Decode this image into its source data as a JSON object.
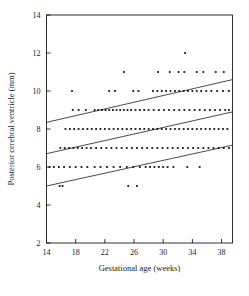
{
  "chart_data": {
    "type": "scatter",
    "title": "",
    "xlabel": "Gestational age (weeks)",
    "ylabel": "Posterior cerebral ventricle (mm)",
    "xlim": [
      14,
      39.5
    ],
    "ylim": [
      2,
      14
    ],
    "xticks": [
      14,
      18,
      22,
      26,
      30,
      34,
      38
    ],
    "xticklabels": [
      "14",
      "18",
      "22",
      "26",
      "30",
      "34",
      "38"
    ],
    "yticks": [
      2,
      4,
      6,
      8,
      10,
      12,
      14
    ],
    "yticklabels": [
      "2",
      "4",
      "6",
      "8",
      "10",
      "12",
      "14"
    ],
    "grid": false,
    "legend": null,
    "marker": "small-filled-square",
    "marker_color": "#111111",
    "points": [
      {
        "x": 33.0,
        "y": 12
      },
      {
        "x": 24.6,
        "y": 11
      },
      {
        "x": 29.3,
        "y": 11
      },
      {
        "x": 30.9,
        "y": 11
      },
      {
        "x": 32.1,
        "y": 11
      },
      {
        "x": 32.9,
        "y": 11
      },
      {
        "x": 34.6,
        "y": 11
      },
      {
        "x": 35.5,
        "y": 11
      },
      {
        "x": 37.2,
        "y": 11
      },
      {
        "x": 38.3,
        "y": 11
      },
      {
        "x": 17.5,
        "y": 10
      },
      {
        "x": 22.6,
        "y": 10
      },
      {
        "x": 23.4,
        "y": 10
      },
      {
        "x": 25.9,
        "y": 10
      },
      {
        "x": 26.6,
        "y": 10
      },
      {
        "x": 28.6,
        "y": 10
      },
      {
        "x": 29.2,
        "y": 10
      },
      {
        "x": 29.8,
        "y": 10
      },
      {
        "x": 30.4,
        "y": 10
      },
      {
        "x": 31.0,
        "y": 10
      },
      {
        "x": 31.6,
        "y": 10
      },
      {
        "x": 32.2,
        "y": 10
      },
      {
        "x": 32.8,
        "y": 10
      },
      {
        "x": 33.4,
        "y": 10
      },
      {
        "x": 34.0,
        "y": 10
      },
      {
        "x": 34.6,
        "y": 10
      },
      {
        "x": 35.2,
        "y": 10
      },
      {
        "x": 35.9,
        "y": 10
      },
      {
        "x": 36.6,
        "y": 10
      },
      {
        "x": 37.4,
        "y": 10
      },
      {
        "x": 38.2,
        "y": 10
      },
      {
        "x": 39.0,
        "y": 10
      },
      {
        "x": 17.6,
        "y": 9
      },
      {
        "x": 18.4,
        "y": 9
      },
      {
        "x": 19.4,
        "y": 9
      },
      {
        "x": 20.6,
        "y": 9
      },
      {
        "x": 21.1,
        "y": 9
      },
      {
        "x": 21.6,
        "y": 9
      },
      {
        "x": 22.1,
        "y": 9
      },
      {
        "x": 22.6,
        "y": 9
      },
      {
        "x": 23.1,
        "y": 9
      },
      {
        "x": 23.6,
        "y": 9
      },
      {
        "x": 24.1,
        "y": 9
      },
      {
        "x": 24.6,
        "y": 9
      },
      {
        "x": 25.1,
        "y": 9
      },
      {
        "x": 25.6,
        "y": 9
      },
      {
        "x": 26.2,
        "y": 9
      },
      {
        "x": 26.8,
        "y": 9
      },
      {
        "x": 27.4,
        "y": 9
      },
      {
        "x": 28.0,
        "y": 9
      },
      {
        "x": 28.7,
        "y": 9
      },
      {
        "x": 29.4,
        "y": 9
      },
      {
        "x": 30.1,
        "y": 9
      },
      {
        "x": 30.8,
        "y": 9
      },
      {
        "x": 31.5,
        "y": 9
      },
      {
        "x": 32.2,
        "y": 9
      },
      {
        "x": 32.9,
        "y": 9
      },
      {
        "x": 33.6,
        "y": 9
      },
      {
        "x": 34.3,
        "y": 9
      },
      {
        "x": 35.0,
        "y": 9
      },
      {
        "x": 35.7,
        "y": 9
      },
      {
        "x": 36.4,
        "y": 9
      },
      {
        "x": 37.1,
        "y": 9
      },
      {
        "x": 37.8,
        "y": 9
      },
      {
        "x": 38.5,
        "y": 9
      },
      {
        "x": 39.0,
        "y": 9
      },
      {
        "x": 16.6,
        "y": 8
      },
      {
        "x": 17.2,
        "y": 8
      },
      {
        "x": 17.8,
        "y": 8
      },
      {
        "x": 18.4,
        "y": 8
      },
      {
        "x": 19.0,
        "y": 8
      },
      {
        "x": 19.6,
        "y": 8
      },
      {
        "x": 20.2,
        "y": 8
      },
      {
        "x": 20.8,
        "y": 8
      },
      {
        "x": 21.4,
        "y": 8
      },
      {
        "x": 22.0,
        "y": 8
      },
      {
        "x": 22.6,
        "y": 8
      },
      {
        "x": 23.2,
        "y": 8
      },
      {
        "x": 23.8,
        "y": 8
      },
      {
        "x": 24.4,
        "y": 8
      },
      {
        "x": 25.0,
        "y": 8
      },
      {
        "x": 25.6,
        "y": 8
      },
      {
        "x": 26.2,
        "y": 8
      },
      {
        "x": 26.8,
        "y": 8
      },
      {
        "x": 27.4,
        "y": 8
      },
      {
        "x": 28.0,
        "y": 8
      },
      {
        "x": 28.6,
        "y": 8
      },
      {
        "x": 29.2,
        "y": 8
      },
      {
        "x": 29.8,
        "y": 8
      },
      {
        "x": 30.4,
        "y": 8
      },
      {
        "x": 31.0,
        "y": 8
      },
      {
        "x": 31.6,
        "y": 8
      },
      {
        "x": 32.2,
        "y": 8
      },
      {
        "x": 32.8,
        "y": 8
      },
      {
        "x": 33.4,
        "y": 8
      },
      {
        "x": 34.0,
        "y": 8
      },
      {
        "x": 34.6,
        "y": 8
      },
      {
        "x": 35.2,
        "y": 8
      },
      {
        "x": 35.8,
        "y": 8
      },
      {
        "x": 36.4,
        "y": 8
      },
      {
        "x": 37.0,
        "y": 8
      },
      {
        "x": 37.6,
        "y": 8
      },
      {
        "x": 38.2,
        "y": 8
      },
      {
        "x": 38.8,
        "y": 8
      },
      {
        "x": 15.9,
        "y": 7
      },
      {
        "x": 16.5,
        "y": 7
      },
      {
        "x": 17.1,
        "y": 7
      },
      {
        "x": 17.7,
        "y": 7
      },
      {
        "x": 18.3,
        "y": 7
      },
      {
        "x": 18.9,
        "y": 7
      },
      {
        "x": 19.5,
        "y": 7
      },
      {
        "x": 20.1,
        "y": 7
      },
      {
        "x": 20.8,
        "y": 7
      },
      {
        "x": 21.5,
        "y": 7
      },
      {
        "x": 22.2,
        "y": 7
      },
      {
        "x": 22.9,
        "y": 7
      },
      {
        "x": 23.6,
        "y": 7
      },
      {
        "x": 24.3,
        "y": 7
      },
      {
        "x": 25.0,
        "y": 7
      },
      {
        "x": 25.7,
        "y": 7
      },
      {
        "x": 26.4,
        "y": 7
      },
      {
        "x": 27.1,
        "y": 7
      },
      {
        "x": 27.8,
        "y": 7
      },
      {
        "x": 28.5,
        "y": 7
      },
      {
        "x": 29.2,
        "y": 7
      },
      {
        "x": 29.9,
        "y": 7
      },
      {
        "x": 30.6,
        "y": 7
      },
      {
        "x": 31.3,
        "y": 7
      },
      {
        "x": 32.0,
        "y": 7
      },
      {
        "x": 32.7,
        "y": 7
      },
      {
        "x": 33.4,
        "y": 7
      },
      {
        "x": 34.1,
        "y": 7
      },
      {
        "x": 34.8,
        "y": 7
      },
      {
        "x": 35.5,
        "y": 7
      },
      {
        "x": 36.2,
        "y": 7
      },
      {
        "x": 36.9,
        "y": 7
      },
      {
        "x": 37.6,
        "y": 7
      },
      {
        "x": 38.3,
        "y": 7
      },
      {
        "x": 39.0,
        "y": 7
      },
      {
        "x": 14.4,
        "y": 6
      },
      {
        "x": 15.0,
        "y": 6
      },
      {
        "x": 15.7,
        "y": 6
      },
      {
        "x": 16.4,
        "y": 6
      },
      {
        "x": 17.2,
        "y": 6
      },
      {
        "x": 18.0,
        "y": 6
      },
      {
        "x": 18.8,
        "y": 6
      },
      {
        "x": 19.6,
        "y": 6
      },
      {
        "x": 20.6,
        "y": 6
      },
      {
        "x": 21.4,
        "y": 6
      },
      {
        "x": 22.3,
        "y": 6
      },
      {
        "x": 23.2,
        "y": 6
      },
      {
        "x": 24.1,
        "y": 6
      },
      {
        "x": 25.0,
        "y": 6
      },
      {
        "x": 25.9,
        "y": 6
      },
      {
        "x": 26.8,
        "y": 6
      },
      {
        "x": 27.6,
        "y": 6
      },
      {
        "x": 28.2,
        "y": 6
      },
      {
        "x": 28.8,
        "y": 6
      },
      {
        "x": 29.4,
        "y": 6
      },
      {
        "x": 30.0,
        "y": 6
      },
      {
        "x": 30.6,
        "y": 6
      },
      {
        "x": 31.4,
        "y": 6
      },
      {
        "x": 33.3,
        "y": 6
      },
      {
        "x": 35.0,
        "y": 6
      },
      {
        "x": 15.8,
        "y": 5
      },
      {
        "x": 16.2,
        "y": 5
      },
      {
        "x": 25.2,
        "y": 5
      },
      {
        "x": 26.4,
        "y": 5
      }
    ],
    "regression_lines": [
      {
        "name": "upper-limit-line",
        "x": [
          14,
          39.5
        ],
        "y": [
          8.35,
          10.6
        ]
      },
      {
        "name": "mean-line",
        "x": [
          14,
          39.5
        ],
        "y": [
          6.7,
          8.9
        ]
      },
      {
        "name": "lower-limit-line",
        "x": [
          14,
          39.5
        ],
        "y": [
          5.0,
          7.15
        ]
      }
    ]
  }
}
